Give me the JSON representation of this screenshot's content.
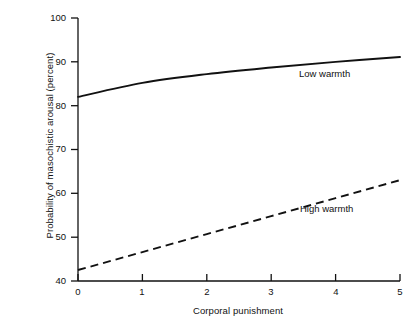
{
  "chart_data": {
    "type": "line",
    "title": "",
    "xlabel": "Corporal punishment",
    "ylabel": "Probability of masochistic arousal (percent)",
    "xlim": [
      0,
      5
    ],
    "ylim": [
      40,
      100
    ],
    "xticks": [
      "0",
      "1",
      "2",
      "3",
      "4",
      "5"
    ],
    "yticks": [
      "40",
      "50",
      "60",
      "70",
      "80",
      "90",
      "100"
    ],
    "grid": false,
    "legend_position": "inline-annotation",
    "x": [
      0,
      1,
      2,
      3,
      4,
      5
    ],
    "series": [
      {
        "name": "Low warmth",
        "style": "solid",
        "color": "#111111",
        "values": [
          82.0,
          85.2,
          87.2,
          88.7,
          90.0,
          91.1
        ]
      },
      {
        "name": "High warmth",
        "style": "dashed",
        "color": "#111111",
        "values": [
          42.5,
          46.6,
          50.7,
          54.8,
          58.9,
          63.0
        ]
      }
    ],
    "annotations": [
      {
        "text": "Low warmth",
        "x": 3.45,
        "y": 87.0
      },
      {
        "text": "High warmth",
        "x": 3.45,
        "y": 56.0
      }
    ]
  },
  "axes": {
    "y_title": "Probability of masochistic arousal (percent)",
    "x_title": "Corporal punishment",
    "y_labels": {
      "t100": "100",
      "t90": "90",
      "t80": "80",
      "t70": "70",
      "t60": "60",
      "t50": "50",
      "t40": "40"
    },
    "x_labels": {
      "t0": "0",
      "t1": "1",
      "t2": "2",
      "t3": "3",
      "t4": "4",
      "t5": "5"
    }
  },
  "labels": {
    "low_warmth": "Low warmth",
    "high_warmth": "High warmth"
  },
  "colors": {
    "axis": "#111111",
    "line": "#111111",
    "background": "#ffffff"
  }
}
